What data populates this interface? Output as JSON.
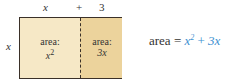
{
  "top_labels": {
    "left": "x",
    "plus": "+",
    "right": "3"
  },
  "side_label": "x",
  "cells": {
    "left": {
      "label": "area:",
      "value_base": "x",
      "value_exp": "2"
    },
    "right": {
      "label": "area:",
      "value": "3x"
    }
  },
  "equation": {
    "lhs": "area",
    "equals": "=",
    "term1_base": "x",
    "term1_exp": "2",
    "plus": "+",
    "term2": "3x"
  },
  "colors": {
    "left_fill": "#f6e8c6",
    "right_fill": "#ecd39c",
    "accent": "#3d8fd1"
  }
}
